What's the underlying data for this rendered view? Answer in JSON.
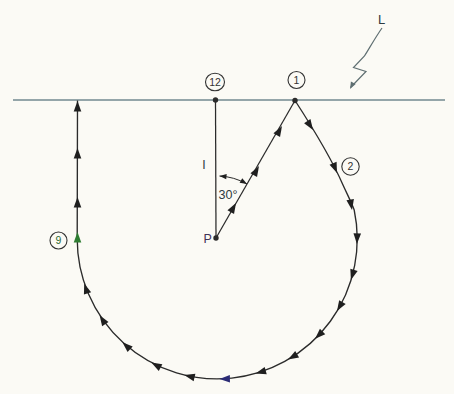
{
  "colors": {
    "background": "#fbfaf5",
    "ink": "#2b2b2b",
    "arrow": "#1f1f1f",
    "arrow_green": "#2e7d32",
    "arrow_navy": "#2b2b75",
    "surface_line": "#72888f",
    "callout": "#5f6f72",
    "marker_ink": "#333333",
    "marker_green": "#2e6b33",
    "label_ink": "#2f3a40",
    "label_p": "#3f3356"
  },
  "labels": {
    "surface": "L",
    "length": "l",
    "angle": "30°",
    "center": "P"
  },
  "clock_markers": [
    {
      "value": "12"
    },
    {
      "value": "1"
    },
    {
      "value": "2"
    },
    {
      "value": "9"
    }
  ]
}
